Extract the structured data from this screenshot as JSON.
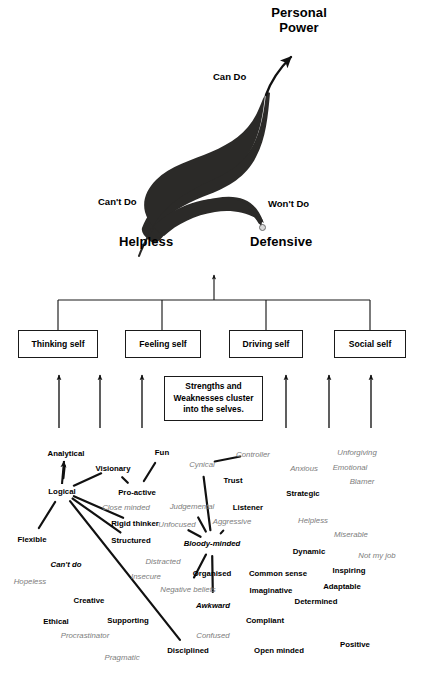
{
  "title_block": {
    "personal_power_line1": "Personal",
    "personal_power_line2": "Power"
  },
  "axis_labels": {
    "can_do": "Can Do",
    "cant_do": "Can't Do",
    "wont_do": "Won't Do",
    "helpless": "Helpless",
    "defensive": "Defensive"
  },
  "selves": {
    "boxes": [
      {
        "label": "Thinking self"
      },
      {
        "label": "Feeling self"
      },
      {
        "label": "Driving self"
      },
      {
        "label": "Social self"
      }
    ],
    "note": {
      "line1": "Strengths and",
      "line2": "Weaknesses cluster",
      "line3": "into the selves."
    }
  },
  "word_cloud": {
    "legend": {
      "strength_style": "bold black",
      "weakness_style": "grey italic"
    },
    "words": [
      {
        "text": "Analytical",
        "x": 66,
        "y": 453,
        "kind": "strength"
      },
      {
        "text": "Visionary",
        "x": 113,
        "y": 468,
        "kind": "strength"
      },
      {
        "text": "Fun",
        "x": 162,
        "y": 452,
        "kind": "strength"
      },
      {
        "text": "Cynical",
        "x": 202,
        "y": 464,
        "kind": "weakness"
      },
      {
        "text": "Controller",
        "x": 253,
        "y": 454,
        "kind": "weakness"
      },
      {
        "text": "Unforgiving",
        "x": 357,
        "y": 452,
        "kind": "weakness"
      },
      {
        "text": "Anxious",
        "x": 304,
        "y": 468,
        "kind": "weakness"
      },
      {
        "text": "Emotional",
        "x": 350,
        "y": 467,
        "kind": "weakness"
      },
      {
        "text": "Logical",
        "x": 62,
        "y": 491,
        "kind": "strength"
      },
      {
        "text": "Pro-active",
        "x": 137,
        "y": 492,
        "kind": "strength"
      },
      {
        "text": "Trust",
        "x": 233,
        "y": 480,
        "kind": "strength"
      },
      {
        "text": "Blamer",
        "x": 362,
        "y": 481,
        "kind": "weakness"
      },
      {
        "text": "Strategic",
        "x": 303,
        "y": 493,
        "kind": "strength"
      },
      {
        "text": "Close minded",
        "x": 126,
        "y": 507,
        "kind": "weakness"
      },
      {
        "text": "Judgemental",
        "x": 192,
        "y": 506,
        "kind": "weakness"
      },
      {
        "text": "Listener",
        "x": 248,
        "y": 507,
        "kind": "strength"
      },
      {
        "text": "Rigid thinker",
        "x": 135,
        "y": 523,
        "kind": "strength"
      },
      {
        "text": "Unfocused",
        "x": 177,
        "y": 524,
        "kind": "weakness"
      },
      {
        "text": "Aggressive",
        "x": 232,
        "y": 521,
        "kind": "weakness"
      },
      {
        "text": "Helpless",
        "x": 313,
        "y": 520,
        "kind": "weakness"
      },
      {
        "text": "Miserable",
        "x": 351,
        "y": 534,
        "kind": "weakness"
      },
      {
        "text": "Flexible",
        "x": 32,
        "y": 539,
        "kind": "strength"
      },
      {
        "text": "Structured",
        "x": 131,
        "y": 540,
        "kind": "strength"
      },
      {
        "text": "Bloody-minded",
        "x": 212,
        "y": 543,
        "kind": "bi"
      },
      {
        "text": "Dynamic",
        "x": 309,
        "y": 551,
        "kind": "strength"
      },
      {
        "text": "Not my job",
        "x": 377,
        "y": 555,
        "kind": "weakness"
      },
      {
        "text": "Can't do",
        "x": 66,
        "y": 564,
        "kind": "bi"
      },
      {
        "text": "Distracted",
        "x": 163,
        "y": 561,
        "kind": "weakness"
      },
      {
        "text": "Insecure",
        "x": 146,
        "y": 576,
        "kind": "weakness"
      },
      {
        "text": "Organised",
        "x": 212,
        "y": 573,
        "kind": "strength"
      },
      {
        "text": "Common sense",
        "x": 278,
        "y": 573,
        "kind": "strength"
      },
      {
        "text": "Inspiring",
        "x": 349,
        "y": 570,
        "kind": "strength"
      },
      {
        "text": "Hopeless",
        "x": 30,
        "y": 581,
        "kind": "weakness"
      },
      {
        "text": "Negative beliefs",
        "x": 188,
        "y": 589,
        "kind": "weakness"
      },
      {
        "text": "Imaginative",
        "x": 271,
        "y": 590,
        "kind": "strength"
      },
      {
        "text": "Adaptable",
        "x": 342,
        "y": 586,
        "kind": "strength"
      },
      {
        "text": "Creative",
        "x": 89,
        "y": 600,
        "kind": "strength"
      },
      {
        "text": "Awkward",
        "x": 213,
        "y": 605,
        "kind": "bi"
      },
      {
        "text": "Determined",
        "x": 316,
        "y": 601,
        "kind": "strength"
      },
      {
        "text": "Ethical",
        "x": 56,
        "y": 621,
        "kind": "strength"
      },
      {
        "text": "Supporting",
        "x": 128,
        "y": 620,
        "kind": "strength"
      },
      {
        "text": "Compliant",
        "x": 265,
        "y": 620,
        "kind": "strength"
      },
      {
        "text": "Procrastinator",
        "x": 85,
        "y": 635,
        "kind": "weakness"
      },
      {
        "text": "Confused",
        "x": 213,
        "y": 635,
        "kind": "weakness"
      },
      {
        "text": "Positive",
        "x": 355,
        "y": 644,
        "kind": "strength"
      },
      {
        "text": "Pragmatic",
        "x": 122,
        "y": 657,
        "kind": "weakness"
      },
      {
        "text": "Disciplined",
        "x": 188,
        "y": 650,
        "kind": "strength"
      },
      {
        "text": "Open minded",
        "x": 279,
        "y": 650,
        "kind": "strength"
      }
    ],
    "links": [
      {
        "from": "Logical",
        "to": "Analytical"
      },
      {
        "from": "Logical",
        "to": "Visionary"
      },
      {
        "from": "Visionary",
        "to": "Pro-active"
      },
      {
        "from": "Fun",
        "to": "Pro-active"
      },
      {
        "from": "Logical",
        "to": "Rigid thinker"
      },
      {
        "from": "Logical",
        "to": "Structured"
      },
      {
        "from": "Logical",
        "to": "Flexible"
      },
      {
        "from": "Logical",
        "to": "Disciplined"
      },
      {
        "from": "Cynical",
        "to": "Controller"
      },
      {
        "from": "Cynical",
        "to": "Bloody-minded"
      },
      {
        "from": "Judgemental",
        "to": "Bloody-minded"
      },
      {
        "from": "Unfocused",
        "to": "Bloody-minded"
      },
      {
        "from": "Aggressive",
        "to": "Bloody-minded"
      },
      {
        "from": "Bloody-minded",
        "to": "Negative beliefs"
      },
      {
        "from": "Bloody-minded",
        "to": "Awkward"
      }
    ]
  },
  "colors": {
    "ink": "#000000",
    "grey_text": "#7d7d7d",
    "line": "#1a1a1a",
    "fill": "#2b2a28"
  }
}
